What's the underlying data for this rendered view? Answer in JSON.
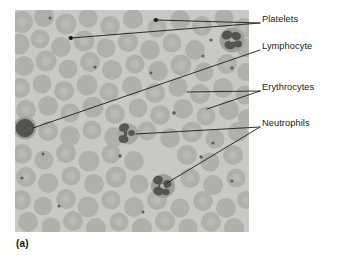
{
  "figure": {
    "caption": "(a)",
    "panel_name": "blood-smear-micrograph",
    "image_region": {
      "x": 15,
      "y": 10,
      "width": 234,
      "height": 222
    },
    "background_color": "#ffffff",
    "smear_background_color": "#c9c9c5",
    "erythrocyte_color": "#a3a39e",
    "leukocyte_color": "#2b2b2b",
    "leader_line_color": "#1c1c1c"
  },
  "annotations": [
    {
      "id": "platelets",
      "label": "Platelets",
      "text_x": 262,
      "text_y": 19,
      "leaders": [
        {
          "x1": 260,
          "y1": 23,
          "x2": 156,
          "y2": 20,
          "dot": true
        },
        {
          "x1": 260,
          "y1": 23,
          "x2": 71,
          "y2": 38,
          "dot": true
        }
      ]
    },
    {
      "id": "lymphocyte",
      "label": "Lymphocyte",
      "text_x": 262,
      "text_y": 46,
      "leaders": [
        {
          "x1": 260,
          "y1": 50,
          "x2": 33,
          "y2": 128,
          "dot": false
        }
      ]
    },
    {
      "id": "erythrocytes",
      "label": "Erythrocytes",
      "text_x": 262,
      "text_y": 87,
      "leaders": [
        {
          "x1": 260,
          "y1": 91,
          "x2": 187,
          "y2": 92,
          "dot": false
        },
        {
          "x1": 260,
          "y1": 91,
          "x2": 207,
          "y2": 109,
          "dot": false
        }
      ]
    },
    {
      "id": "neutrophils",
      "label": "Neutrophils",
      "text_x": 262,
      "text_y": 123,
      "leaders": [
        {
          "x1": 260,
          "y1": 127,
          "x2": 136,
          "y2": 134,
          "dot": false
        },
        {
          "x1": 260,
          "y1": 127,
          "x2": 167,
          "y2": 183,
          "dot": false
        }
      ]
    }
  ],
  "cell_features": {
    "lymphocyte": {
      "cx": 25,
      "cy": 128,
      "r": 9.5
    },
    "neutrophils": [
      {
        "cx": 128,
        "cy": 134,
        "r": 9
      },
      {
        "cx": 163,
        "cy": 186,
        "r": 11
      }
    ],
    "dark_cell_top_right": {
      "cx": 232,
      "cy": 40,
      "r": 11
    },
    "platelet_dots": [
      {
        "cx": 155,
        "cy": 20
      },
      {
        "cx": 70,
        "cy": 38
      },
      {
        "cx": 50,
        "cy": 18
      },
      {
        "cx": 211,
        "cy": 40
      },
      {
        "cx": 203,
        "cy": 56
      },
      {
        "cx": 232,
        "cy": 68
      },
      {
        "cx": 174,
        "cy": 113
      },
      {
        "cx": 95,
        "cy": 67
      },
      {
        "cx": 151,
        "cy": 73
      },
      {
        "cx": 120,
        "cy": 156
      },
      {
        "cx": 43,
        "cy": 154
      },
      {
        "cx": 213,
        "cy": 143
      },
      {
        "cx": 201,
        "cy": 157
      },
      {
        "cx": 232,
        "cy": 181
      },
      {
        "cx": 59,
        "cy": 206
      },
      {
        "cx": 22,
        "cy": 178
      },
      {
        "cx": 143,
        "cy": 212
      }
    ]
  }
}
